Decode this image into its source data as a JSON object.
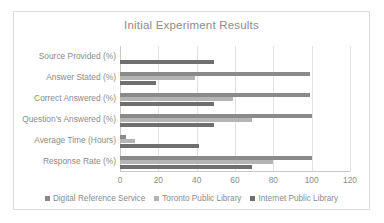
{
  "chart_data": {
    "type": "bar",
    "orientation": "horizontal",
    "title": "Initial Experiment Results",
    "xlabel": "",
    "ylabel": "",
    "xlim": [
      0,
      120
    ],
    "xticks": [
      0,
      20,
      40,
      60,
      80,
      100,
      120
    ],
    "grid": true,
    "legend_position": "bottom",
    "categories": [
      "Source Provided (%)",
      "Answer  Stated (%)",
      "Correct Answered (%)",
      "Question’s Answered (%)",
      "Average Time (Hours)",
      "Response Rate (%)"
    ],
    "series": [
      {
        "name": "Digital Reference Service",
        "color": "#8a8a8a",
        "values": [
          0,
          99,
          99,
          100,
          3,
          100
        ]
      },
      {
        "name": "Toronto  Public Library",
        "color": "#b4b4b4",
        "values": [
          0,
          39,
          59,
          69,
          8,
          80
        ]
      },
      {
        "name": "Internet Public Library",
        "color": "#6f6f6f",
        "values": [
          49,
          19,
          49,
          49,
          41,
          69
        ]
      }
    ]
  },
  "legend": {
    "items": [
      {
        "label": "Digital Reference Service",
        "color": "#8a8a8a"
      },
      {
        "label": "Toronto  Public Library",
        "color": "#b4b4b4"
      },
      {
        "label": "Internet Public Library",
        "color": "#6f6f6f"
      }
    ]
  }
}
